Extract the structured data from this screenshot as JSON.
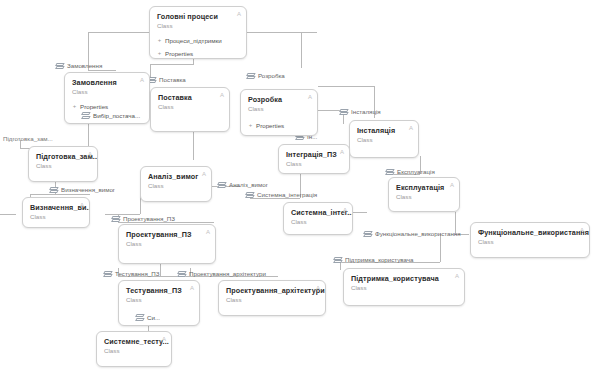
{
  "diagram": {
    "type": "uml-class-diagram",
    "language": "uk",
    "background": "#ffffff",
    "line_color": "#b9b9b9",
    "node_border_color": "#cfcfcf",
    "stereotype_default": "Class"
  },
  "nodes": [
    {
      "id": "golovni_procesy",
      "title": "Головні процеси",
      "stereotype": "Class",
      "corner": "A",
      "members": [
        {
          "label": "Процеси_підтримки",
          "bullet": "+",
          "indent": false
        },
        {
          "label": "Properties",
          "bullet": "+",
          "indent": false
        }
      ]
    },
    {
      "id": "zamovlennya",
      "title": "Замовлення",
      "stereotype": "Class",
      "corner": "A",
      "members": [
        {
          "label": "Properties",
          "bullet": "+",
          "indent": false
        },
        {
          "label": "Вибір_постача...",
          "bullet": "",
          "indent": true
        }
      ]
    },
    {
      "id": "postavka",
      "title": "Поставка",
      "stereotype": "Class",
      "corner": "A",
      "members": []
    },
    {
      "id": "rozrobka",
      "title": "Розробка",
      "stereotype": "Class",
      "corner": "A",
      "members": [
        {
          "label": "Properties",
          "bullet": "+",
          "indent": false
        }
      ]
    },
    {
      "id": "instalyaciya",
      "title": "Інсталяція",
      "stereotype": "Class",
      "corner": "A",
      "members": []
    },
    {
      "id": "integraciya_pz",
      "title": "Інтеграція_ПЗ",
      "stereotype": "Class",
      "corner": "A",
      "members": []
    },
    {
      "id": "pidgotovka_zam",
      "title": "Підготовка_зам...",
      "stereotype": "Class",
      "corner": "A",
      "members": []
    },
    {
      "id": "analiz_vymog",
      "title": "Аналіз_вимог",
      "stereotype": "Class",
      "corner": "A",
      "members": []
    },
    {
      "id": "vyznachennya_vy",
      "title": "Визначення_ви...",
      "stereotype": "Class",
      "corner": "A",
      "members": []
    },
    {
      "id": "systemna_integr",
      "title": "Системна_інтег...",
      "stereotype": "Class",
      "corner": "A",
      "members": []
    },
    {
      "id": "ekspluataciya",
      "title": "Експлуатація",
      "stereotype": "Class",
      "corner": "A",
      "members": []
    },
    {
      "id": "proektuvannya_pz",
      "title": "Проектування_ПЗ",
      "stereotype": "Class",
      "corner": "A",
      "members": []
    },
    {
      "id": "funkcionalne_vykorystannya",
      "title": "Функціональне_використання",
      "stereotype": "Class",
      "corner": "A",
      "members": []
    },
    {
      "id": "pidtrymka_korystuvacha",
      "title": "Підтримка_користувача",
      "stereotype": "Class",
      "corner": "A",
      "members": []
    },
    {
      "id": "testuvannya_pz",
      "title": "Тестування_ПЗ",
      "stereotype": "Class",
      "corner": "A",
      "members": [
        {
          "label": "Си...",
          "bullet": "",
          "indent": true
        }
      ]
    },
    {
      "id": "proektuvannya_arhitektury",
      "title": "Проектування_архітектури",
      "stereotype": "Class",
      "corner": "A",
      "members": []
    },
    {
      "id": "systemne_testu",
      "title": "Системне_тесту...",
      "stereotype": "Class",
      "corner": "A",
      "members": []
    }
  ],
  "tags": [
    {
      "id": "tag_zamovlennya",
      "label": "Замовлення",
      "glyph": true
    },
    {
      "id": "tag_postavka",
      "label": "Поставка",
      "glyph": true
    },
    {
      "id": "tag_rozrobka",
      "label": "Розробка",
      "glyph": true
    },
    {
      "id": "tag_instalyaciya",
      "label": "Інсталяція",
      "glyph": true
    },
    {
      "id": "tag_in",
      "label": "Ін...",
      "glyph": true
    },
    {
      "id": "tag_pidgotovka",
      "label": "Підготовка_зам...",
      "glyph": false
    },
    {
      "id": "tag_vyznachennya",
      "label": "Визначення_вимог",
      "glyph": true
    },
    {
      "id": "tag_analiz_vymog",
      "label": "Аналіз_вимог",
      "glyph": true
    },
    {
      "id": "tag_systemna_integr",
      "label": "Системна_інтеграція",
      "glyph": true
    },
    {
      "id": "tag_ekspluataciya",
      "label": "Експлуатація",
      "glyph": true
    },
    {
      "id": "tag_proektuvannya_pz",
      "label": "Проектування_ПЗ",
      "glyph": true
    },
    {
      "id": "tag_funkcionalne",
      "label": "Функціональне_використання",
      "glyph": true
    },
    {
      "id": "tag_pidtrymka",
      "label": "Підтримка_користувача",
      "glyph": true
    },
    {
      "id": "tag_testuvannya_pz",
      "label": "Тестування_ПЗ",
      "glyph": true
    },
    {
      "id": "tag_proekt_arh",
      "label": "Проектування_архітектури",
      "glyph": true
    },
    {
      "id": "tag_si",
      "label": "Си...",
      "glyph": true
    }
  ]
}
